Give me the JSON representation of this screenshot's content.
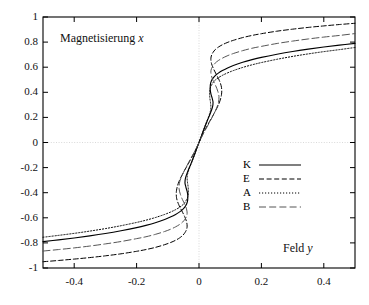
{
  "chart_data": {
    "type": "line",
    "title": "",
    "xlabel": "Feld y",
    "ylabel": "Magnetisierung x",
    "xlabel_text": "Feld",
    "xlabel_var": "y",
    "ylabel_text": "Magnetisierung",
    "ylabel_var": "x",
    "xlim": [
      -0.5,
      0.5
    ],
    "ylim": [
      -1,
      1
    ],
    "grid": true,
    "grid_lines": [
      "x=0",
      "y=0"
    ],
    "legend_position": "center-right",
    "xticks": [
      -0.4,
      -0.2,
      0,
      0.2,
      0.4
    ],
    "xtick_labels": [
      "-0.4",
      "-0.2",
      "0",
      "0.2",
      "0.4"
    ],
    "yticks": [
      1,
      0.8,
      0.6,
      0.4,
      0.2,
      0,
      -0.2,
      -0.4,
      -0.6,
      -0.8,
      -1
    ],
    "ytick_labels": [
      "1",
      "0.8",
      "0.6",
      "0.4",
      "0.2",
      "0",
      "-0.2",
      "-0.4",
      "-0.6",
      "-0.8",
      "-1"
    ],
    "note": "Sigmoid / S-shaped magnetisation curves x as function of field y; each curve plotted as y(x) with slight overhang near the centre.",
    "series": [
      {
        "name": "K",
        "label": "K",
        "dash": "solid",
        "color": "#000000",
        "x_at_minus_half": -0.79,
        "x_at_plus_half": 0.81,
        "points": [
          [
            -0.5,
            -0.79
          ],
          [
            -0.45,
            -0.776
          ],
          [
            -0.4,
            -0.761
          ],
          [
            -0.35,
            -0.744
          ],
          [
            -0.3,
            -0.725
          ],
          [
            -0.25,
            -0.703
          ],
          [
            -0.2,
            -0.678
          ],
          [
            -0.17,
            -0.66
          ],
          [
            -0.14,
            -0.639
          ],
          [
            -0.11,
            -0.613
          ],
          [
            -0.09,
            -0.592
          ],
          [
            -0.075,
            -0.573
          ],
          [
            -0.062,
            -0.553
          ],
          [
            -0.052,
            -0.533
          ],
          [
            -0.045,
            -0.513
          ],
          [
            -0.04,
            -0.492
          ],
          [
            -0.037,
            -0.47
          ],
          [
            -0.036,
            -0.447
          ],
          [
            -0.036,
            -0.42
          ],
          [
            -0.038,
            -0.39
          ],
          [
            -0.042,
            -0.355
          ],
          [
            -0.045,
            -0.32
          ],
          [
            -0.043,
            -0.28
          ],
          [
            -0.036,
            -0.23
          ],
          [
            -0.026,
            -0.17
          ],
          [
            -0.015,
            -0.1
          ],
          [
            -0.007,
            -0.045
          ],
          [
            0.0,
            0.0
          ],
          [
            0.007,
            0.045
          ],
          [
            0.015,
            0.1
          ],
          [
            0.026,
            0.17
          ],
          [
            0.036,
            0.23
          ],
          [
            0.043,
            0.28
          ],
          [
            0.045,
            0.32
          ],
          [
            0.042,
            0.355
          ],
          [
            0.038,
            0.39
          ],
          [
            0.036,
            0.42
          ],
          [
            0.036,
            0.447
          ],
          [
            0.037,
            0.47
          ],
          [
            0.04,
            0.492
          ],
          [
            0.045,
            0.513
          ],
          [
            0.052,
            0.533
          ],
          [
            0.062,
            0.553
          ],
          [
            0.075,
            0.573
          ],
          [
            0.09,
            0.592
          ],
          [
            0.11,
            0.613
          ],
          [
            0.14,
            0.639
          ],
          [
            0.17,
            0.66
          ],
          [
            0.2,
            0.678
          ],
          [
            0.25,
            0.703
          ],
          [
            0.3,
            0.725
          ],
          [
            0.35,
            0.744
          ],
          [
            0.4,
            0.761
          ],
          [
            0.45,
            0.776
          ],
          [
            0.5,
            0.79
          ]
        ]
      },
      {
        "name": "E",
        "label": "E",
        "dash": "dashed",
        "color": "#000000",
        "x_at_minus_half": -0.95,
        "x_at_plus_half": 0.95,
        "points": [
          [
            -0.5,
            -0.95
          ],
          [
            -0.45,
            -0.94
          ],
          [
            -0.4,
            -0.929
          ],
          [
            -0.35,
            -0.917
          ],
          [
            -0.3,
            -0.903
          ],
          [
            -0.25,
            -0.887
          ],
          [
            -0.2,
            -0.867
          ],
          [
            -0.17,
            -0.853
          ],
          [
            -0.14,
            -0.836
          ],
          [
            -0.11,
            -0.814
          ],
          [
            -0.09,
            -0.796
          ],
          [
            -0.075,
            -0.779
          ],
          [
            -0.062,
            -0.76
          ],
          [
            -0.052,
            -0.74
          ],
          [
            -0.045,
            -0.718
          ],
          [
            -0.04,
            -0.694
          ],
          [
            -0.038,
            -0.666
          ],
          [
            -0.04,
            -0.63
          ],
          [
            -0.046,
            -0.59
          ],
          [
            -0.055,
            -0.545
          ],
          [
            -0.065,
            -0.495
          ],
          [
            -0.072,
            -0.44
          ],
          [
            -0.072,
            -0.38
          ],
          [
            -0.064,
            -0.31
          ],
          [
            -0.048,
            -0.23
          ],
          [
            -0.03,
            -0.15
          ],
          [
            -0.014,
            -0.075
          ],
          [
            0.0,
            0.0
          ],
          [
            0.014,
            0.075
          ],
          [
            0.03,
            0.15
          ],
          [
            0.048,
            0.23
          ],
          [
            0.064,
            0.31
          ],
          [
            0.072,
            0.38
          ],
          [
            0.072,
            0.44
          ],
          [
            0.065,
            0.495
          ],
          [
            0.055,
            0.545
          ],
          [
            0.046,
            0.59
          ],
          [
            0.04,
            0.63
          ],
          [
            0.038,
            0.666
          ],
          [
            0.04,
            0.694
          ],
          [
            0.045,
            0.718
          ],
          [
            0.052,
            0.74
          ],
          [
            0.062,
            0.76
          ],
          [
            0.075,
            0.779
          ],
          [
            0.09,
            0.796
          ],
          [
            0.11,
            0.814
          ],
          [
            0.14,
            0.836
          ],
          [
            0.17,
            0.853
          ],
          [
            0.2,
            0.867
          ],
          [
            0.25,
            0.887
          ],
          [
            0.3,
            0.903
          ],
          [
            0.35,
            0.917
          ],
          [
            0.4,
            0.929
          ],
          [
            0.45,
            0.94
          ],
          [
            0.5,
            0.95
          ]
        ]
      },
      {
        "name": "A",
        "label": "A",
        "dash": "dotted",
        "color": "#000000",
        "x_at_minus_half": -0.755,
        "x_at_plus_half": 0.757,
        "points": [
          [
            -0.5,
            -0.755
          ],
          [
            -0.45,
            -0.74
          ],
          [
            -0.4,
            -0.724
          ],
          [
            -0.35,
            -0.706
          ],
          [
            -0.3,
            -0.686
          ],
          [
            -0.25,
            -0.663
          ],
          [
            -0.2,
            -0.637
          ],
          [
            -0.17,
            -0.619
          ],
          [
            -0.14,
            -0.598
          ],
          [
            -0.11,
            -0.573
          ],
          [
            -0.09,
            -0.553
          ],
          [
            -0.075,
            -0.535
          ],
          [
            -0.062,
            -0.516
          ],
          [
            -0.052,
            -0.497
          ],
          [
            -0.045,
            -0.477
          ],
          [
            -0.04,
            -0.456
          ],
          [
            -0.036,
            -0.433
          ],
          [
            -0.034,
            -0.408
          ],
          [
            -0.034,
            -0.38
          ],
          [
            -0.035,
            -0.35
          ],
          [
            -0.037,
            -0.315
          ],
          [
            -0.038,
            -0.28
          ],
          [
            -0.036,
            -0.245
          ],
          [
            -0.03,
            -0.2
          ],
          [
            -0.022,
            -0.15
          ],
          [
            -0.013,
            -0.09
          ],
          [
            -0.006,
            -0.04
          ],
          [
            0.0,
            0.0
          ],
          [
            0.006,
            0.04
          ],
          [
            0.013,
            0.09
          ],
          [
            0.022,
            0.15
          ],
          [
            0.03,
            0.2
          ],
          [
            0.036,
            0.245
          ],
          [
            0.038,
            0.28
          ],
          [
            0.037,
            0.315
          ],
          [
            0.035,
            0.35
          ],
          [
            0.034,
            0.38
          ],
          [
            0.034,
            0.408
          ],
          [
            0.036,
            0.433
          ],
          [
            0.04,
            0.456
          ],
          [
            0.045,
            0.477
          ],
          [
            0.052,
            0.497
          ],
          [
            0.062,
            0.516
          ],
          [
            0.075,
            0.535
          ],
          [
            0.09,
            0.553
          ],
          [
            0.11,
            0.573
          ],
          [
            0.14,
            0.598
          ],
          [
            0.17,
            0.619
          ],
          [
            0.2,
            0.637
          ],
          [
            0.25,
            0.663
          ],
          [
            0.3,
            0.686
          ],
          [
            0.35,
            0.706
          ],
          [
            0.4,
            0.724
          ],
          [
            0.45,
            0.74
          ],
          [
            0.5,
            0.757
          ]
        ]
      },
      {
        "name": "B",
        "label": "B",
        "dash": "longdash",
        "color": "#555555",
        "x_at_minus_half": -0.865,
        "x_at_plus_half": 0.868,
        "points": [
          [
            -0.5,
            -0.865
          ],
          [
            -0.45,
            -0.853
          ],
          [
            -0.4,
            -0.84
          ],
          [
            -0.35,
            -0.825
          ],
          [
            -0.3,
            -0.808
          ],
          [
            -0.25,
            -0.789
          ],
          [
            -0.2,
            -0.766
          ],
          [
            -0.17,
            -0.751
          ],
          [
            -0.14,
            -0.732
          ],
          [
            -0.11,
            -0.709
          ],
          [
            -0.09,
            -0.69
          ],
          [
            -0.075,
            -0.672
          ],
          [
            -0.062,
            -0.653
          ],
          [
            -0.052,
            -0.633
          ],
          [
            -0.045,
            -0.611
          ],
          [
            -0.04,
            -0.588
          ],
          [
            -0.038,
            -0.562
          ],
          [
            -0.04,
            -0.53
          ],
          [
            -0.045,
            -0.495
          ],
          [
            -0.053,
            -0.455
          ],
          [
            -0.06,
            -0.41
          ],
          [
            -0.064,
            -0.365
          ],
          [
            -0.062,
            -0.315
          ],
          [
            -0.054,
            -0.26
          ],
          [
            -0.041,
            -0.195
          ],
          [
            -0.026,
            -0.125
          ],
          [
            -0.012,
            -0.062
          ],
          [
            0.0,
            0.0
          ],
          [
            0.012,
            0.062
          ],
          [
            0.026,
            0.125
          ],
          [
            0.041,
            0.195
          ],
          [
            0.054,
            0.26
          ],
          [
            0.062,
            0.315
          ],
          [
            0.064,
            0.365
          ],
          [
            0.06,
            0.41
          ],
          [
            0.053,
            0.455
          ],
          [
            0.045,
            0.495
          ],
          [
            0.04,
            0.53
          ],
          [
            0.038,
            0.562
          ],
          [
            0.04,
            0.588
          ],
          [
            0.045,
            0.611
          ],
          [
            0.052,
            0.633
          ],
          [
            0.062,
            0.653
          ],
          [
            0.075,
            0.672
          ],
          [
            0.09,
            0.69
          ],
          [
            0.11,
            0.709
          ],
          [
            0.14,
            0.732
          ],
          [
            0.17,
            0.751
          ],
          [
            0.2,
            0.766
          ],
          [
            0.25,
            0.789
          ],
          [
            0.3,
            0.808
          ],
          [
            0.35,
            0.825
          ],
          [
            0.4,
            0.84
          ],
          [
            0.45,
            0.853
          ],
          [
            0.5,
            0.868
          ]
        ]
      }
    ]
  },
  "legend": {
    "entries": [
      {
        "label": "K"
      },
      {
        "label": "E"
      },
      {
        "label": "A"
      },
      {
        "label": "B"
      }
    ]
  },
  "colors": {
    "axis": "#000000",
    "grid": "#c8c8c8",
    "curve": "#000000",
    "curve_b": "#555555",
    "background": "#ffffff"
  }
}
